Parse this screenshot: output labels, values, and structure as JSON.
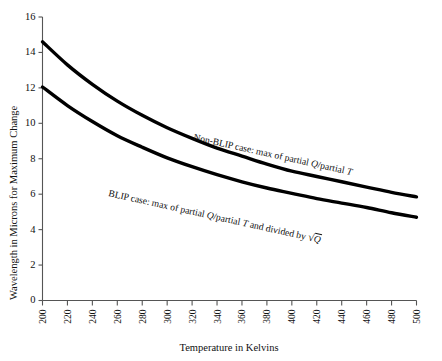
{
  "chart_data": {
    "type": "line",
    "title": "",
    "xlabel": "Temperature in Kelvins",
    "ylabel": "Wavelength in Microns for Maximum Change",
    "xlim": [
      200,
      500
    ],
    "ylim": [
      0,
      16
    ],
    "xticks": [
      200,
      220,
      240,
      260,
      280,
      300,
      320,
      340,
      360,
      380,
      400,
      420,
      440,
      460,
      480,
      500
    ],
    "yticks": [
      0,
      2,
      4,
      6,
      8,
      10,
      12,
      14,
      16
    ],
    "grid": false,
    "legend_position": "inline-annotations",
    "x": [
      200,
      220,
      240,
      260,
      280,
      300,
      320,
      340,
      360,
      380,
      400,
      420,
      440,
      460,
      480,
      500
    ],
    "series": [
      {
        "name": "Non-BLIP case: max of partial Q/partial T",
        "color": "#000000",
        "values": [
          14.6,
          13.3,
          12.2,
          11.25,
          10.45,
          9.75,
          9.15,
          8.6,
          8.15,
          7.7,
          7.3,
          7.0,
          6.7,
          6.4,
          6.1,
          5.85
        ]
      },
      {
        "name": "BLIP case: max of partial Q/partial T and divided by √Q",
        "color": "#000000",
        "values": [
          12.05,
          11.0,
          10.1,
          9.3,
          8.65,
          8.05,
          7.55,
          7.1,
          6.7,
          6.35,
          6.05,
          5.75,
          5.5,
          5.25,
          4.95,
          4.7
        ]
      }
    ],
    "annotations": [
      {
        "id": "non-blip",
        "text": "Non-BLIP case: max of partial Q/partial T",
        "prefix": "Non-BLIP case: max of partial ",
        "italic_a": "Q",
        "middle": "/partial ",
        "italic_b": "T",
        "suffix": ""
      },
      {
        "id": "blip",
        "text": "BLIP case: max of partial Q/partial T and divided by √Q",
        "prefix": "BLIP case: max of partial ",
        "italic_a": "Q",
        "middle": "/partial ",
        "italic_b": "T",
        "suffix": " and divided by ",
        "radical": "√",
        "italic_c": "Q"
      }
    ]
  },
  "axes": {
    "y_title": "Wavelength in Microns for Maximum Change",
    "x_title": "Temperature in Kelvins"
  }
}
